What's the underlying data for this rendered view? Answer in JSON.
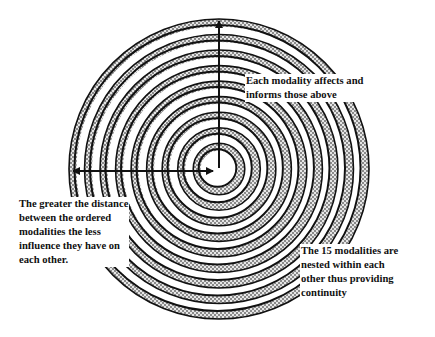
{
  "diagram": {
    "type": "concentric-rings",
    "center": {
      "x": 219,
      "y": 169
    },
    "inner_radius": 18,
    "outer_radius": 150,
    "ring_count": 9,
    "colors": {
      "stroke": "#111111",
      "hatch_dark": "#8a8a8a",
      "hatch_light": "#e6e6e6",
      "background": "#ffffff"
    },
    "arrows": [
      {
        "name": "vertical-arrow",
        "from": "center",
        "to": "top",
        "direction": "up"
      },
      {
        "name": "horizontal-arrow",
        "from": "left-edge",
        "to": "center",
        "direction": "both"
      }
    ]
  },
  "labels": {
    "top": {
      "lines": [
        "Each modality affects and",
        "informs those above"
      ]
    },
    "left": {
      "lines": [
        "The greater the distance",
        "between the ordered",
        "modalities the less",
        "influence they have on",
        "each other."
      ]
    },
    "right": {
      "lines": [
        "The 15 modalities are",
        "nested within each",
        "other thus providing",
        "continuity"
      ]
    }
  },
  "label_text": {
    "top": "Each modality affects and\ninforms those above",
    "left": "The greater the distance\nbetween the ordered\nmodalities the less\ninfluence they have on\neach other.",
    "right": "The 15 modalities are\nnested within each\nother thus providing\ncontinuity"
  }
}
